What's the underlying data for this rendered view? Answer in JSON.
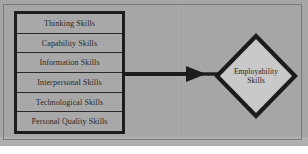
{
  "figure": {
    "type": "flow-diagram",
    "background_color": "#a6a6a6",
    "frame_color": "#7b7b7b",
    "ink_color": "#1c1c1c",
    "node_fill_color": "#c9c9c9"
  },
  "skills_table": {
    "name": "employability-skills-components",
    "rows": [
      {
        "label": "Thinking Skills"
      },
      {
        "label": "Capability Skills"
      },
      {
        "label": "Information Skills"
      },
      {
        "label": "Interpersonal Skills"
      },
      {
        "label": "Technological Skills"
      },
      {
        "label": "Personal Quality Skills"
      }
    ]
  },
  "connector": {
    "name": "rightward-arrow",
    "direction": "right",
    "label": ""
  },
  "outcome_node": {
    "shape": "diamond",
    "line1": "Employability",
    "line2": "Skills"
  }
}
